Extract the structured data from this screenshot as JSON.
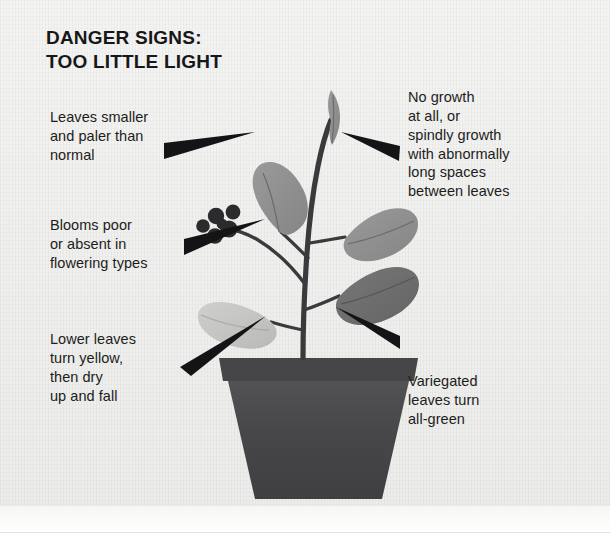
{
  "figure": {
    "title": "DANGER SIGNS:\nTOO LITTLE LIGHT",
    "style": "grayscale-scanned-diagram",
    "background_color": "#f1f1ef",
    "ink_color": "#1d1d20"
  },
  "callouts": [
    {
      "id": "leaves-smaller",
      "side": "left",
      "text": "Leaves smaller\nand paler than\nnormal",
      "points_to": "upper-left-leaf"
    },
    {
      "id": "blooms-poor",
      "side": "left",
      "text": "Blooms poor\nor absent in\nflowering types",
      "points_to": "flower-cluster"
    },
    {
      "id": "lower-leaves",
      "side": "left",
      "text": "Lower leaves\nturn yellow,\nthen dry\nup and fall",
      "points_to": "pale-lower-leaf"
    },
    {
      "id": "no-growth",
      "side": "right",
      "text": "No growth\nat all, or\nspindly growth\nwith abnormally\nlong spaces\nbetween leaves",
      "points_to": "upper-stem-tip"
    },
    {
      "id": "variegated",
      "side": "right",
      "text": "Variegated\nleaves turn\nall-green",
      "points_to": "lower-right-leaf"
    }
  ],
  "plant": {
    "colors": {
      "stem": "#3a3a3c",
      "leaf_mid": "#8e8e8e",
      "leaf_dark": "#6d6d6d",
      "leaf_pale": "#c4c4c2",
      "leaf_vein": "#5c5c5c",
      "flower": "#2b2b2d",
      "pot": "#4a4a4c",
      "pot_rim": "#444446",
      "arrow": "#141416"
    },
    "parts": [
      {
        "name": "top-bud-leaf",
        "shade": "mid",
        "description": "narrow upright bud-like leaf at stem tip"
      },
      {
        "name": "upper-left-leaf",
        "shade": "mid",
        "description": "oval leaf angled up-left"
      },
      {
        "name": "upper-right-leaf",
        "shade": "mid",
        "description": "oval leaf angled right"
      },
      {
        "name": "lower-right-leaf",
        "shade": "dark",
        "description": "large dark oval leaf angled down-right"
      },
      {
        "name": "pale-lower-leaf",
        "shade": "pale",
        "description": "pale yellowing leaf angled down-left"
      },
      {
        "name": "flower-cluster",
        "shade": "flower",
        "description": "cluster of five dark blooms on a side stem"
      },
      {
        "name": "pot",
        "shade": "pot",
        "description": "tapered flower pot with rim"
      }
    ]
  }
}
